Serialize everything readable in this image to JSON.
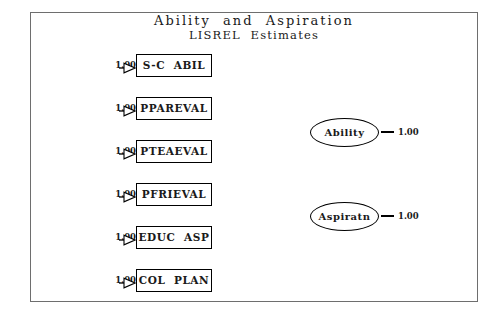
{
  "title": {
    "main": "Ability  and  Aspiration",
    "sub": "LISREL  Estimates"
  },
  "indicators": [
    {
      "label": "S-C  ABIL",
      "coefficient": "1.00"
    },
    {
      "label": "PPAREVAL",
      "coefficient": "1.00"
    },
    {
      "label": "PTEAEVAL",
      "coefficient": "1.00"
    },
    {
      "label": "PFRIEVAL",
      "coefficient": "1.00"
    },
    {
      "label": "EDUC  ASP",
      "coefficient": "1.00"
    },
    {
      "label": "COL  PLAN",
      "coefficient": "1.00"
    }
  ],
  "latents": [
    {
      "label": "Ability",
      "coefficient": "1.00"
    },
    {
      "label": "Aspiratn",
      "coefficient": "1.00"
    }
  ],
  "colors": {
    "frame": "#6e6e6e",
    "stroke": "#000000",
    "background": "#ffffff",
    "text": "#1a1a1a"
  }
}
